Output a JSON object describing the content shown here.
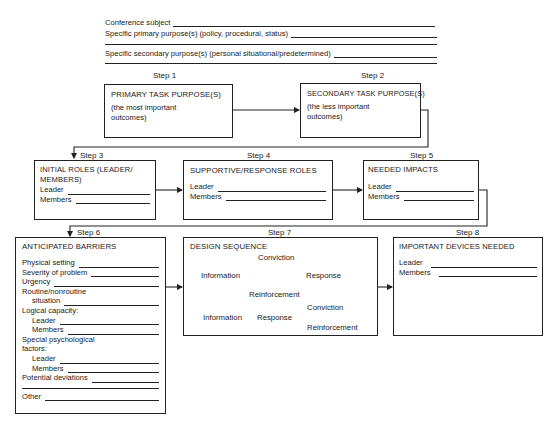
{
  "header": {
    "conference_subject_label": "Conference subject",
    "primary_purpose_label": "Specific primary purpose(s) (policy, procedural, status)",
    "secondary_purpose_label": "Specific secondary purpose(s) (personal situational/predetermined)"
  },
  "steps": [
    {
      "step": "Step 1",
      "title": "PRIMARY TASK PURPOSE(S)",
      "note": "(the most important outcomes)"
    },
    {
      "step": "Step 2",
      "title": "SECONDARY TASK PURPOSE(S)",
      "note": "(the less important outcomes)"
    },
    {
      "step": "Step 3",
      "title": "INITIAL ROLES (LEADER/ MEMBERS)",
      "fields": [
        "Leader",
        "Members"
      ]
    },
    {
      "step": "Step 4",
      "title": "SUPPORTIVE/RESPONSE ROLES",
      "fields": [
        "Leader",
        "Members"
      ]
    },
    {
      "step": "Step 5",
      "title": "NEEDED IMPACTS",
      "fields": [
        "Leader",
        "Members"
      ]
    },
    {
      "step": "Step 6",
      "title": "ANTICIPATED BARRIERS",
      "fields": {
        "physical_setting": "Physical setting",
        "severity": "Severity of problem",
        "urgency": "Urgency",
        "routine": "Routine/nonroutine",
        "situation": "situation",
        "logical_capacity": "Logical capacity:",
        "leader": "Leader",
        "members": "Members",
        "special_psych": "Special psychological",
        "factors": "factors:",
        "potential_deviations": "Potential deviations",
        "other": "Other"
      }
    },
    {
      "step": "Step 7",
      "title": "DESIGN SEQUENCE",
      "cycle": {
        "information": "Information",
        "conviction": "Conviction",
        "response": "Response",
        "reinforcement": "Reinforcement"
      },
      "branch": {
        "information": "Information",
        "response": "Response",
        "conviction": "Conviction",
        "reinforcement": "Reinforcement"
      }
    },
    {
      "step": "Step 8",
      "title": "IMPORTANT DEVICES NEEDED",
      "fields": [
        "Leader",
        "Members"
      ]
    }
  ]
}
